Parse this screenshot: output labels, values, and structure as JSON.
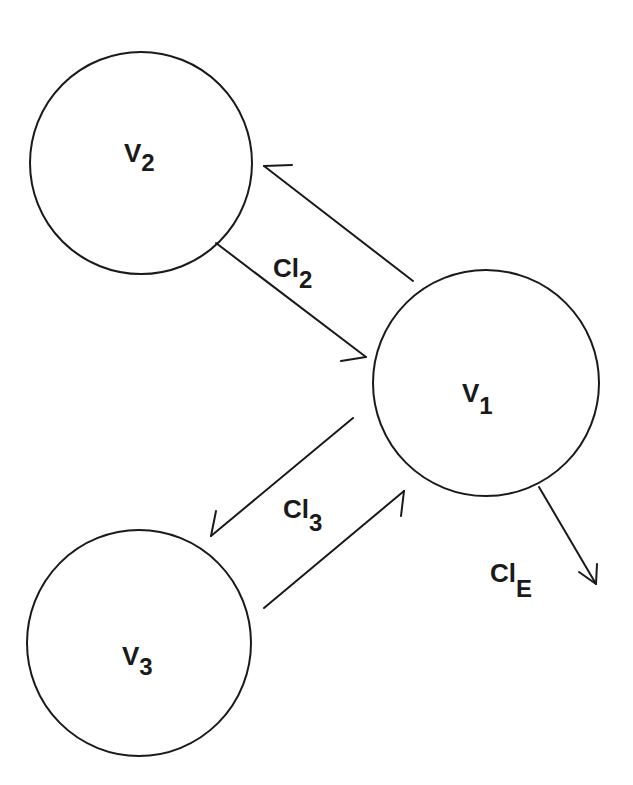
{
  "diagram": {
    "type": "compartment-model",
    "colors": {
      "stroke": "#1a1a1a",
      "background": "#ffffff"
    },
    "nodes": [
      {
        "id": "V1",
        "main": "V",
        "sub": "1"
      },
      {
        "id": "V2",
        "main": "V",
        "sub": "2"
      },
      {
        "id": "V3",
        "main": "V",
        "sub": "3"
      }
    ],
    "edges": [
      {
        "from": "V1",
        "to": "V2",
        "label_main": "",
        "label_sub": ""
      },
      {
        "from": "V2",
        "to": "V1",
        "label_main": "Cl",
        "label_sub": "2"
      },
      {
        "from": "V1",
        "to": "V3",
        "label_main": "Cl",
        "label_sub": "3"
      },
      {
        "from": "V3",
        "to": "V1",
        "label_main": "",
        "label_sub": ""
      },
      {
        "from": "V1",
        "to": "out",
        "label_main": "Cl",
        "label_sub": "E"
      }
    ]
  }
}
